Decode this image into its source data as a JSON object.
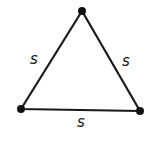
{
  "diagram": {
    "type": "equilateral-triangle",
    "stroke_color": "#1a1a1a",
    "background": "#ffffff",
    "vertices": [
      {
        "name": "top",
        "x": 82,
        "y": 11
      },
      {
        "name": "bottom-left",
        "x": 21,
        "y": 109
      },
      {
        "name": "bottom-right",
        "x": 140,
        "y": 111
      }
    ],
    "side_labels": {
      "left": "s",
      "right": "s",
      "bottom": "s"
    }
  }
}
